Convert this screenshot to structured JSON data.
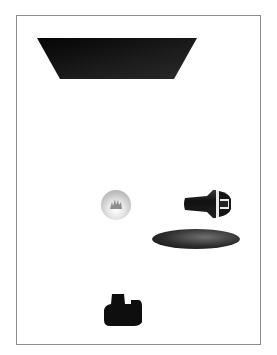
{
  "scene": {
    "background": "#ffffff",
    "frame_color": "#8c8c8c",
    "objects": [
      {
        "name": "trapezoid",
        "shape": "inverted trapezoid",
        "color": "#141414"
      },
      {
        "name": "sphere",
        "shape": "glass sphere with flame",
        "color": "#c8c8c8"
      },
      {
        "name": "knob",
        "shape": "tapered knob / plug",
        "color": "#1a1a1a"
      },
      {
        "name": "disc",
        "shape": "flat ellipse disc",
        "color": "#2c2c2c"
      },
      {
        "name": "camera",
        "shape": "camera silhouette",
        "color": "#0e0e0e"
      }
    ]
  }
}
